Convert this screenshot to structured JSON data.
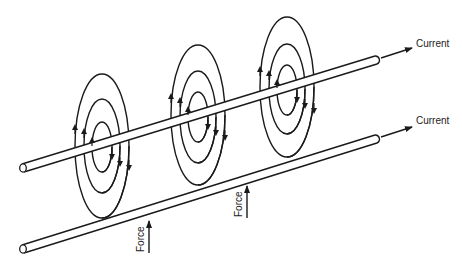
{
  "diagram": {
    "labels": {
      "current_top": "Current",
      "current_bottom": "Current",
      "force_left": "Force",
      "force_right": "Force"
    },
    "colors": {
      "stroke": "#1a1a1a",
      "text": "#222222",
      "background": "#ffffff"
    },
    "wires": [
      {
        "name": "upper-wire",
        "start": [
          22,
          168
        ],
        "end": [
          375,
          60
        ]
      },
      {
        "name": "lower-wire",
        "start": [
          22,
          249
        ],
        "end": [
          375,
          139
        ]
      }
    ],
    "field_ring_sets": [
      {
        "cx": 102,
        "cy": 146,
        "rings": [
          {
            "rx": 27,
            "ry": 72
          },
          {
            "rx": 18,
            "ry": 47
          },
          {
            "rx": 10,
            "ry": 25
          }
        ]
      },
      {
        "cx": 198,
        "cy": 115,
        "rings": [
          {
            "rx": 27,
            "ry": 70
          },
          {
            "rx": 18,
            "ry": 46
          },
          {
            "rx": 10,
            "ry": 25
          }
        ]
      },
      {
        "cx": 287,
        "cy": 87,
        "rings": [
          {
            "rx": 27,
            "ry": 70
          },
          {
            "rx": 18,
            "ry": 45
          },
          {
            "rx": 10,
            "ry": 25
          }
        ]
      }
    ]
  }
}
